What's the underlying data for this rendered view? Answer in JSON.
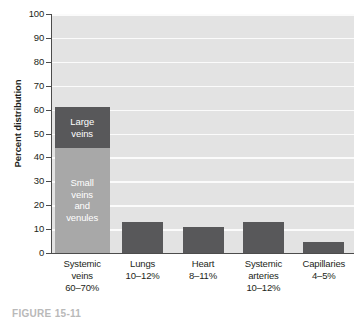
{
  "chart_data": {
    "type": "bar",
    "title": "",
    "xlabel": "",
    "ylabel": "Percent distribution",
    "ylim": [
      0,
      100
    ],
    "yticks": [
      0,
      10,
      20,
      30,
      40,
      50,
      60,
      70,
      80,
      90,
      100
    ],
    "ytick_labels": [
      "0",
      "10",
      "20",
      "30",
      "40",
      "50",
      "60",
      "70",
      "80",
      "90",
      "100"
    ],
    "grid": true,
    "legend": "none",
    "categories": [
      "Systemic veins 60–70%",
      "Lungs 10–12%",
      "Heart 8–11%",
      "Systemic arteries 10–12%",
      "Capillaries 4–5%"
    ],
    "category_lines": [
      [
        "Systemic",
        "veins",
        "60–70%"
      ],
      [
        "Lungs",
        "10–12%"
      ],
      [
        "Heart",
        "8–11%"
      ],
      [
        "Systemic",
        "arteries",
        "10–12%"
      ],
      [
        "Capillaries",
        "4–5%"
      ]
    ],
    "stacked": true,
    "series": [
      {
        "name": "Small veins and venules",
        "values": [
          44,
          0,
          0,
          0,
          0
        ],
        "color": "#a8a8a8"
      },
      {
        "name": "Large veins",
        "values": [
          17,
          13,
          11,
          13,
          4.6
        ],
        "color": "#58585a"
      }
    ],
    "totals": [
      61,
      13,
      11,
      13,
      4.6
    ],
    "bar_labels": [
      {
        "text": "Large veins",
        "lines": [
          "Large",
          "veins"
        ],
        "segment": "Large veins",
        "bar": 0
      },
      {
        "text": "Small veins and venules",
        "lines": [
          "Small",
          "veins",
          "and",
          "venules"
        ],
        "segment": "Small veins and venules",
        "bar": 0
      }
    ],
    "colors": {
      "bar_dark": "#58585a",
      "bar_light": "#a8a8a8",
      "plot_background": "#e3e3e3",
      "gridline": "#fbfbfb",
      "axis": "#4c4c4c",
      "text": "#231f20",
      "bar_label_text": "#ffffff"
    }
  },
  "caption": {
    "text": "FIGURE 15-11"
  }
}
